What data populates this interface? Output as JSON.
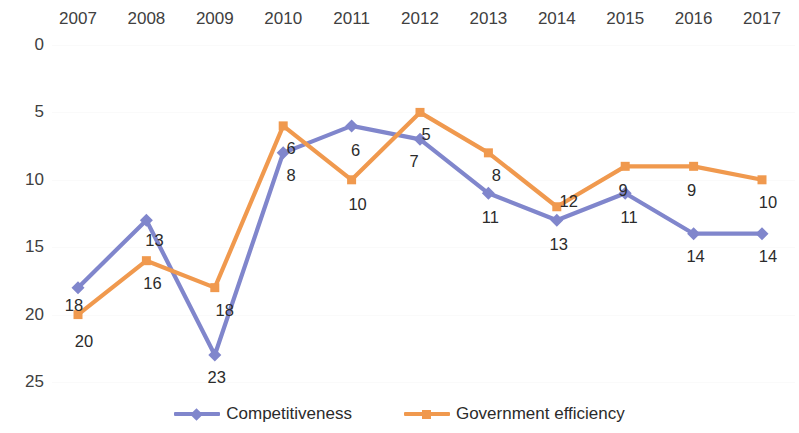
{
  "chart_data": {
    "type": "line",
    "title": "",
    "subtitle": "",
    "xlabel": "",
    "ylabel": "",
    "categories": [
      "2007",
      "2008",
      "2009",
      "2010",
      "2011",
      "2012",
      "2013",
      "2014",
      "2015",
      "2016",
      "2017"
    ],
    "y_ticks": [
      0,
      5,
      10,
      15,
      20,
      25
    ],
    "ylim": [
      0,
      25
    ],
    "y_axis_inverted": true,
    "grid": true,
    "grid_color": "#fafafa",
    "legend_position": "bottom",
    "x_axis_position": "top",
    "series": [
      {
        "name": "Competitiveness",
        "color": "#8086cc",
        "marker": "diamond",
        "values": [
          18,
          13,
          23,
          8,
          6,
          7,
          11,
          13,
          11,
          14,
          14
        ],
        "labels": [
          "18",
          "13",
          "23",
          "8",
          "6",
          "7",
          "11",
          "13",
          "11",
          "14",
          "14"
        ]
      },
      {
        "name": "Government efficiency",
        "color": "#f0994e",
        "marker": "square",
        "values": [
          20,
          16,
          18,
          6,
          10,
          5,
          8,
          12,
          9,
          9,
          10
        ],
        "labels": [
          "20",
          "16",
          "18",
          "6",
          "10",
          "5",
          "8",
          "12",
          "9",
          "9",
          "10"
        ]
      }
    ]
  },
  "legend": {
    "entries": [
      {
        "label": "Competitiveness",
        "color": "#8086cc",
        "marker": "diamond"
      },
      {
        "label": "Government efficiency",
        "color": "#f0994e",
        "marker": "square"
      }
    ]
  }
}
